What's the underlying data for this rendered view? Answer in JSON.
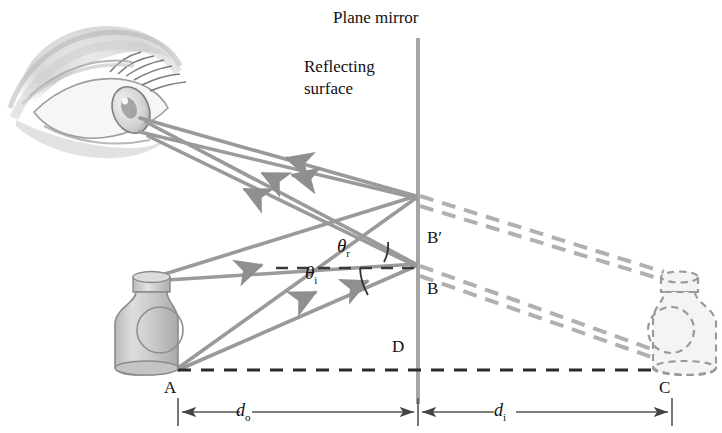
{
  "figure": {
    "title": "Plane mirror",
    "surface_label_line1": "Reflecting",
    "surface_label_line2": "surface",
    "points": {
      "A": "A",
      "B": "B",
      "B_prime": "B′",
      "C": "C",
      "D": "D"
    },
    "angles": {
      "incidence": "θ",
      "incidence_sub": "i",
      "reflection": "θ",
      "reflection_sub": "r"
    },
    "dimensions": {
      "object_distance": "d",
      "object_distance_sub": "o",
      "image_distance": "d",
      "image_distance_sub": "i"
    },
    "colors": {
      "ray": "#9a9a9a",
      "mirror": "#a5a5a5",
      "dashed_ray": "#b0b0b0",
      "normal_line": "#3a3a3a",
      "baseline": "#2b2b2b",
      "dimension_line": "#555555",
      "object_fill": "#c9c9c9",
      "object_stroke": "#8a8a8a",
      "image_fill": "#f2f2f2",
      "image_stroke": "#9a9a9a",
      "text": "#111111"
    },
    "objects": {
      "real_bottle_name": "object-bottle",
      "virtual_bottle_name": "image-bottle",
      "eye_name": "observer-eye"
    }
  }
}
